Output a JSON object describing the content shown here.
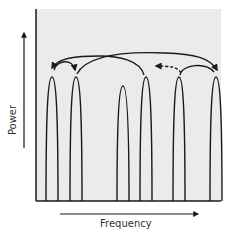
{
  "diagram": {
    "y_axis_label": "Power",
    "x_axis_label": "Frequency",
    "colors": {
      "plot_background": "#ebebeb",
      "stroke": "#1a1a1a",
      "label": "#333333"
    },
    "peaks": [
      {
        "x": 51,
        "width": 11
      },
      {
        "x": 73,
        "width": 12
      },
      {
        "x": 122,
        "width": 11
      },
      {
        "x": 145,
        "width": 12
      },
      {
        "x": 178,
        "width": 12
      },
      {
        "x": 215,
        "width": 11
      }
    ],
    "arrows": [
      {
        "from_peak": 2,
        "to_peak": 0,
        "style": "solid",
        "note": "long arc from mid-peak back to first peak"
      },
      {
        "from_peak": 0,
        "to_peak": 1,
        "style": "solid",
        "note": "short hop between first two peaks"
      },
      {
        "from_peak": 1,
        "to_peak": 5,
        "style": "solid",
        "note": "long arc from second peak to last peak"
      },
      {
        "from_peak": 4,
        "to_peak": 5,
        "style": "solid",
        "note": "short arc between last two peaks"
      },
      {
        "from_peak": 4,
        "to_point": "left-of-peak-4",
        "style": "dashed",
        "note": "dashed arrow pointing left"
      }
    ]
  }
}
